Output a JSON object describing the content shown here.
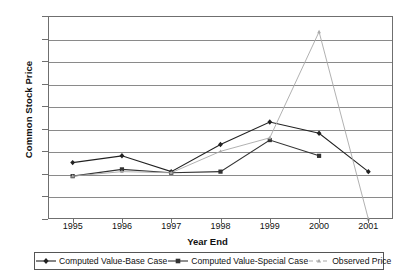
{
  "chart_data": {
    "type": "line",
    "title": "",
    "xlabel": "Year End",
    "ylabel": "Common Stock Price",
    "categories": [
      "1995",
      "1996",
      "1997",
      "1998",
      "1999",
      "2000",
      "2001"
    ],
    "x": [
      1995,
      1996,
      1997,
      1998,
      1999,
      2000,
      2001
    ],
    "ylim": [
      0,
      90
    ],
    "ytick_labels": [
      "0",
      "10",
      "20",
      "30",
      "40",
      "50",
      "60",
      "70",
      "80",
      "90"
    ],
    "ytick_values": [
      0,
      10,
      20,
      30,
      40,
      50,
      60,
      70,
      80,
      90
    ],
    "grid": "horizontal",
    "legend_position": "bottom",
    "series": [
      {
        "name": "Computed Value-Base Case",
        "marker": "diamond",
        "color": "#222222",
        "values": [
          25,
          28,
          21,
          33,
          43,
          38,
          21
        ]
      },
      {
        "name": "Computed Value-Special Case",
        "marker": "square",
        "color": "#333333",
        "values": [
          19,
          22,
          20.5,
          21,
          35,
          28,
          null
        ]
      },
      {
        "name": "Observed Price",
        "marker": "triangle",
        "color": "#a8a8a8",
        "values": [
          19,
          21,
          20.5,
          30,
          36,
          83,
          0
        ]
      }
    ]
  },
  "legend": {
    "items": [
      {
        "label": "Computed Value-Base Case",
        "marker": "diamond-marker-icon",
        "color": "#222222"
      },
      {
        "label": "Computed Value-Special Case",
        "marker": "square-marker-icon",
        "color": "#333333"
      },
      {
        "label": "Observed Price",
        "marker": "triangle-marker-icon",
        "color": "#a8a8a8"
      }
    ]
  },
  "colors": {
    "axis": "#6f6f6f",
    "grid": "#8a8a8a",
    "text": "#111111",
    "background": "#ffffff"
  }
}
